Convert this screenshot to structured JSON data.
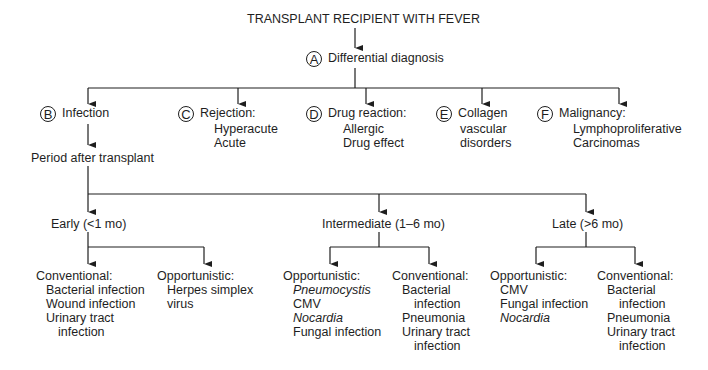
{
  "title": "TRANSPLANT RECIPIENT WITH FEVER",
  "root": {
    "marker": "A",
    "label": "Differential diagnosis"
  },
  "categories": [
    {
      "marker": "B",
      "label": "Infection",
      "items": []
    },
    {
      "marker": "C",
      "label": "Rejection:",
      "items": [
        "Hyperacute",
        "Acute"
      ]
    },
    {
      "marker": "D",
      "label": "Drug reaction:",
      "items": [
        "Allergic",
        "Drug effect"
      ]
    },
    {
      "marker": "E",
      "label": "Collagen",
      "items": [
        "vascular",
        "disorders"
      ]
    },
    {
      "marker": "F",
      "label": "Malignancy:",
      "items": [
        "Lymphoproliferative",
        "Carcinomas"
      ]
    }
  ],
  "period": {
    "label": "Period after transplant"
  },
  "periods": [
    {
      "label": "Early (<1 mo)",
      "groups": [
        {
          "label": "Conventional:",
          "items": [
            "Bacterial infection",
            "Wound infection",
            "Urinary tract",
            "infection"
          ]
        },
        {
          "label": "Opportunistic:",
          "items": [
            "Herpes simplex",
            "virus"
          ]
        }
      ]
    },
    {
      "label": "Intermediate (1–6 mo)",
      "groups": [
        {
          "label": "Opportunistic:",
          "items": [
            "Pneumocystis",
            "CMV",
            "Nocardia",
            "Fungal infection"
          ]
        },
        {
          "label": "Conventional:",
          "items": [
            "Bacterial",
            "infection",
            "Pneumonia",
            "Urinary tract",
            "infection"
          ]
        }
      ]
    },
    {
      "label": "Late (>6 mo)",
      "groups": [
        {
          "label": "Opportunistic:",
          "items": [
            "CMV",
            "Fungal infection",
            "Nocardia"
          ]
        },
        {
          "label": "Conventional:",
          "items": [
            "Bacterial",
            "infection",
            "Pneumonia",
            "Urinary tract",
            "infection"
          ]
        }
      ]
    }
  ],
  "colors": {
    "line": "#1e1e1e",
    "text": "#1e1e1e",
    "background": "#ffffff"
  }
}
